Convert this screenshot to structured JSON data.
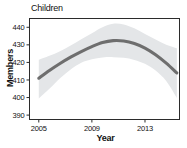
{
  "chart_data": {
    "type": "line",
    "title": "Children",
    "xlabel": "Year",
    "ylabel": "Members",
    "xlim": [
      2004.3,
      2015.6
    ],
    "ylim": [
      387.5,
      445.0
    ],
    "xticks": [
      2005,
      2009,
      2013
    ],
    "xtick_labels": [
      "2005",
      "2009",
      "2013"
    ],
    "yticks": [
      390,
      400,
      410,
      420,
      430,
      440
    ],
    "ytick_labels": [
      "390",
      "400",
      "410",
      "420",
      "430",
      "440"
    ],
    "grid": false,
    "legend": "none",
    "series": [
      {
        "name": "Children members (fitted trend)",
        "color": "#6e6e6e",
        "x": [
          2005.0,
          2005.8,
          2006.6,
          2007.4,
          2008.2,
          2009.0,
          2009.8,
          2010.6,
          2011.4,
          2012.2,
          2013.0,
          2013.8,
          2014.6,
          2015.4
        ],
        "values": [
          411.0,
          415.4,
          419.4,
          423.0,
          426.2,
          429.0,
          431.3,
          432.4,
          432.2,
          430.8,
          428.2,
          424.4,
          419.6,
          414.0
        ]
      }
    ],
    "confidence_band": {
      "name": "95% confidence interval",
      "color": "#e4e6e8",
      "x": [
        2005.0,
        2005.8,
        2006.6,
        2007.4,
        2008.2,
        2009.0,
        2009.8,
        2010.6,
        2011.4,
        2012.2,
        2013.0,
        2013.8,
        2014.6,
        2015.4
      ],
      "upper": [
        421.5,
        423.8,
        426.4,
        429.6,
        433.2,
        436.6,
        440.0,
        442.0,
        441.6,
        439.4,
        436.2,
        433.0,
        430.0,
        428.0
      ],
      "lower": [
        399.5,
        405.0,
        411.0,
        416.0,
        419.8,
        421.8,
        422.8,
        423.0,
        422.6,
        421.4,
        419.2,
        415.4,
        409.4,
        399.8
      ]
    }
  }
}
